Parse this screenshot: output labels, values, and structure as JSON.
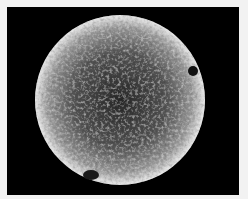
{
  "image": {
    "subject": "scanning electron micrograph of a spherical particle with a rough, fibrous surface",
    "background_color": "#000000",
    "border_color": "#f2f2f2"
  },
  "sphere": {
    "cx": 113,
    "cy": 93,
    "r": 85,
    "highlight_color": "#e6e6e6",
    "mid_color": "#8a8a8a",
    "shadow_color": "#2a2a2a"
  }
}
